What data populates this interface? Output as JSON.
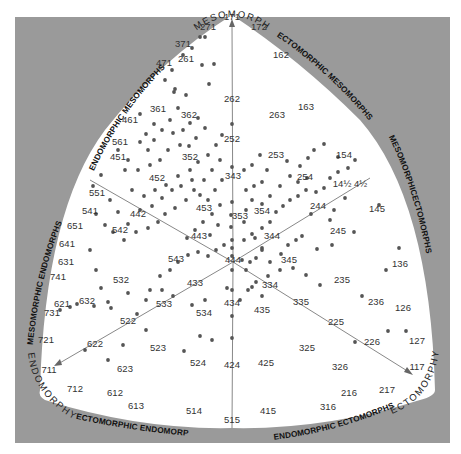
{
  "colors": {
    "frame": "#9a9a9a",
    "field": "#ffffff",
    "dot": "#555555",
    "axis": "#888888",
    "text": "#333333"
  },
  "poles": {
    "top": "MESOMORPHY",
    "left": "ENDOMORPHY",
    "right": "ECTOMORPHY"
  },
  "regions": {
    "upper_left": "ENDOMORPHIC MESOMORPHS",
    "upper_right": "ECTOMORPHIC MESOMORPHS",
    "left": "MESOMORPHIC ENDOMORPHS",
    "right": "MESOMORPHICECTOMORPHS",
    "bottom_left": "ECTOMORPHIC ENDOMORPHS",
    "bottom_right": "ENDOMORPHIC ECTOMORPHS"
  },
  "chart_data": {
    "type": "scatter",
    "title": "",
    "axes": [
      "Endomorphy",
      "Mesomorphy",
      "Ectomorphy"
    ],
    "labels": [
      {
        "text": "171",
        "x": 232,
        "y": 20
      },
      {
        "text": "172",
        "x": 259,
        "y": 30
      },
      {
        "text": "271",
        "x": 208,
        "y": 30
      },
      {
        "text": "371",
        "x": 183,
        "y": 47
      },
      {
        "text": "471",
        "x": 164,
        "y": 66
      },
      {
        "text": "261",
        "x": 186,
        "y": 62
      },
      {
        "text": "162",
        "x": 281,
        "y": 58
      },
      {
        "text": "262",
        "x": 232,
        "y": 102
      },
      {
        "text": "163",
        "x": 306,
        "y": 110
      },
      {
        "text": "263",
        "x": 277,
        "y": 118
      },
      {
        "text": "361",
        "x": 158,
        "y": 112
      },
      {
        "text": "362",
        "x": 189,
        "y": 118
      },
      {
        "text": "461",
        "x": 130,
        "y": 123
      },
      {
        "text": "561",
        "x": 120,
        "y": 145
      },
      {
        "text": "451",
        "x": 118,
        "y": 160
      },
      {
        "text": "252",
        "x": 232,
        "y": 142
      },
      {
        "text": "253",
        "x": 276,
        "y": 158
      },
      {
        "text": "154",
        "x": 344,
        "y": 158
      },
      {
        "text": "352",
        "x": 190,
        "y": 160
      },
      {
        "text": "254",
        "x": 305,
        "y": 180
      },
      {
        "text": "452",
        "x": 157,
        "y": 181
      },
      {
        "text": "343",
        "x": 233,
        "y": 179
      },
      {
        "text": "551",
        "x": 97,
        "y": 196
      },
      {
        "text": "14½ 4½",
        "x": 350,
        "y": 187
      },
      {
        "text": "541",
        "x": 90,
        "y": 214
      },
      {
        "text": "442",
        "x": 138,
        "y": 217
      },
      {
        "text": "453",
        "x": 204,
        "y": 211
      },
      {
        "text": "353",
        "x": 240,
        "y": 219
      },
      {
        "text": "354",
        "x": 262,
        "y": 214
      },
      {
        "text": "244",
        "x": 318,
        "y": 209
      },
      {
        "text": "651",
        "x": 75,
        "y": 229
      },
      {
        "text": "542",
        "x": 120,
        "y": 233
      },
      {
        "text": "443",
        "x": 199,
        "y": 239
      },
      {
        "text": "344",
        "x": 272,
        "y": 239
      },
      {
        "text": "145",
        "x": 377,
        "y": 212
      },
      {
        "text": "245",
        "x": 338,
        "y": 234
      },
      {
        "text": "641",
        "x": 67,
        "y": 247
      },
      {
        "text": "543",
        "x": 176,
        "y": 262
      },
      {
        "text": "444",
        "x": 233,
        "y": 263
      },
      {
        "text": "345",
        "x": 289,
        "y": 263
      },
      {
        "text": "631",
        "x": 66,
        "y": 265
      },
      {
        "text": "136",
        "x": 400,
        "y": 267
      },
      {
        "text": "741",
        "x": 58,
        "y": 280
      },
      {
        "text": "532",
        "x": 121,
        "y": 283
      },
      {
        "text": "235",
        "x": 342,
        "y": 283
      },
      {
        "text": "621",
        "x": 62,
        "y": 307
      },
      {
        "text": "632",
        "x": 87,
        "y": 304
      },
      {
        "text": "433",
        "x": 195,
        "y": 286
      },
      {
        "text": "334",
        "x": 270,
        "y": 288
      },
      {
        "text": "731",
        "x": 52,
        "y": 316
      },
      {
        "text": "533",
        "x": 164,
        "y": 307
      },
      {
        "text": "534",
        "x": 204,
        "y": 316
      },
      {
        "text": "434",
        "x": 232,
        "y": 306
      },
      {
        "text": "435",
        "x": 262,
        "y": 313
      },
      {
        "text": "335",
        "x": 301,
        "y": 305
      },
      {
        "text": "236",
        "x": 376,
        "y": 305
      },
      {
        "text": "126",
        "x": 403,
        "y": 311
      },
      {
        "text": "522",
        "x": 128,
        "y": 324
      },
      {
        "text": "225",
        "x": 336,
        "y": 325
      },
      {
        "text": "721",
        "x": 46,
        "y": 343
      },
      {
        "text": "622",
        "x": 95,
        "y": 347
      },
      {
        "text": "523",
        "x": 158,
        "y": 351
      },
      {
        "text": "325",
        "x": 307,
        "y": 351
      },
      {
        "text": "226",
        "x": 372,
        "y": 345
      },
      {
        "text": "127",
        "x": 417,
        "y": 344
      },
      {
        "text": "711",
        "x": 49,
        "y": 373
      },
      {
        "text": "623",
        "x": 125,
        "y": 372
      },
      {
        "text": "524",
        "x": 198,
        "y": 366
      },
      {
        "text": "424",
        "x": 232,
        "y": 368
      },
      {
        "text": "425",
        "x": 266,
        "y": 366
      },
      {
        "text": "326",
        "x": 340,
        "y": 370
      },
      {
        "text": "117",
        "x": 417,
        "y": 370
      },
      {
        "text": "712",
        "x": 75,
        "y": 392
      },
      {
        "text": "612",
        "x": 115,
        "y": 396
      },
      {
        "text": "613",
        "x": 136,
        "y": 409
      },
      {
        "text": "216",
        "x": 349,
        "y": 396
      },
      {
        "text": "217",
        "x": 387,
        "y": 393
      },
      {
        "text": "514",
        "x": 194,
        "y": 414
      },
      {
        "text": "515",
        "x": 232,
        "y": 423
      },
      {
        "text": "415",
        "x": 268,
        "y": 414
      },
      {
        "text": "316",
        "x": 328,
        "y": 410
      }
    ],
    "axis_lines": [
      {
        "from": [
          233,
          262
        ],
        "to": [
          232,
          25
        ],
        "arrow": true,
        "label": "mesomorphy axis"
      },
      {
        "from": [
          233,
          262
        ],
        "to": [
          58,
          364
        ],
        "arrow": true,
        "label": "endomorphy axis"
      },
      {
        "from": [
          233,
          262
        ],
        "to": [
          409,
          372
        ],
        "arrow": true,
        "label": "ectomorphy axis"
      },
      {
        "from": [
          233,
          262
        ],
        "to": [
          232,
          428
        ],
        "arrow": false
      },
      {
        "from": [
          233,
          262
        ],
        "to": [
          90,
          180
        ],
        "arrow": false
      },
      {
        "from": [
          233,
          262
        ],
        "to": [
          370,
          178
        ],
        "arrow": false
      }
    ],
    "points": [
      [
        200,
        37
      ],
      [
        205,
        37
      ],
      [
        192,
        48
      ],
      [
        183,
        55
      ],
      [
        214,
        64
      ],
      [
        202,
        65
      ],
      [
        172,
        70
      ],
      [
        186,
        95
      ],
      [
        174,
        92
      ],
      [
        209,
        84
      ],
      [
        232,
        124
      ],
      [
        232,
        167
      ],
      [
        232,
        202
      ],
      [
        231,
        215
      ],
      [
        231,
        227
      ],
      [
        232,
        240
      ],
      [
        232,
        248
      ],
      [
        232,
        256
      ],
      [
        175,
        89
      ],
      [
        165,
        80
      ],
      [
        140,
        114
      ],
      [
        154,
        124
      ],
      [
        146,
        134
      ],
      [
        140,
        142
      ],
      [
        148,
        150
      ],
      [
        154,
        140
      ],
      [
        162,
        130
      ],
      [
        170,
        120
      ],
      [
        178,
        108
      ],
      [
        173,
        133
      ],
      [
        183,
        130
      ],
      [
        190,
        123
      ],
      [
        198,
        118
      ],
      [
        205,
        128
      ],
      [
        196,
        138
      ],
      [
        189,
        146
      ],
      [
        180,
        145
      ],
      [
        168,
        150
      ],
      [
        160,
        160
      ],
      [
        150,
        165
      ],
      [
        138,
        170
      ],
      [
        128,
        160
      ],
      [
        118,
        150
      ],
      [
        125,
        170
      ],
      [
        132,
        190
      ],
      [
        144,
        196
      ],
      [
        155,
        190
      ],
      [
        166,
        185
      ],
      [
        178,
        176
      ],
      [
        190,
        170
      ],
      [
        198,
        162
      ],
      [
        208,
        155
      ],
      [
        216,
        145
      ],
      [
        222,
        135
      ],
      [
        220,
        160
      ],
      [
        212,
        170
      ],
      [
        204,
        180
      ],
      [
        194,
        190
      ],
      [
        186,
        200
      ],
      [
        175,
        208
      ],
      [
        165,
        214
      ],
      [
        158,
        222
      ],
      [
        148,
        228
      ],
      [
        136,
        232
      ],
      [
        124,
        240
      ],
      [
        113,
        232
      ],
      [
        105,
        225
      ],
      [
        96,
        214
      ],
      [
        93,
        186
      ],
      [
        101,
        175
      ],
      [
        110,
        200
      ],
      [
        118,
        212
      ],
      [
        128,
        224
      ],
      [
        140,
        210
      ],
      [
        152,
        206
      ],
      [
        162,
        198
      ],
      [
        172,
        190
      ],
      [
        181,
        186
      ],
      [
        192,
        180
      ],
      [
        200,
        195
      ],
      [
        208,
        200
      ],
      [
        215,
        190
      ],
      [
        222,
        180
      ],
      [
        220,
        205
      ],
      [
        212,
        214
      ],
      [
        203,
        222
      ],
      [
        195,
        230
      ],
      [
        187,
        238
      ],
      [
        210,
        235
      ],
      [
        218,
        225
      ],
      [
        224,
        245
      ],
      [
        216,
        250
      ],
      [
        208,
        256
      ],
      [
        198,
        252
      ],
      [
        188,
        255
      ],
      [
        178,
        262
      ],
      [
        170,
        270
      ],
      [
        160,
        276
      ],
      [
        150,
        290
      ],
      [
        242,
        260
      ],
      [
        250,
        262
      ],
      [
        246,
        270
      ],
      [
        256,
        258
      ],
      [
        262,
        248
      ],
      [
        255,
        238
      ],
      [
        262,
        228
      ],
      [
        270,
        222
      ],
      [
        276,
        212
      ],
      [
        283,
        206
      ],
      [
        290,
        200
      ],
      [
        298,
        196
      ],
      [
        306,
        190
      ],
      [
        316,
        192
      ],
      [
        324,
        188
      ],
      [
        330,
        178
      ],
      [
        338,
        172
      ],
      [
        348,
        168
      ],
      [
        355,
        160
      ],
      [
        246,
        190
      ],
      [
        254,
        186
      ],
      [
        262,
        182
      ],
      [
        270,
        196
      ],
      [
        280,
        186
      ],
      [
        290,
        176
      ],
      [
        300,
        166
      ],
      [
        308,
        158
      ],
      [
        314,
        150
      ],
      [
        324,
        144
      ],
      [
        244,
        170
      ],
      [
        252,
        165
      ],
      [
        260,
        155
      ],
      [
        267,
        170
      ],
      [
        287,
        161
      ],
      [
        298,
        182
      ],
      [
        307,
        178
      ],
      [
        338,
        157
      ],
      [
        246,
        210
      ],
      [
        252,
        200
      ],
      [
        262,
        204
      ],
      [
        244,
        222
      ],
      [
        252,
        234
      ],
      [
        244,
        240
      ],
      [
        262,
        250
      ],
      [
        270,
        262
      ],
      [
        281,
        254
      ],
      [
        288,
        245
      ],
      [
        296,
        240
      ],
      [
        302,
        236
      ],
      [
        311,
        214
      ],
      [
        330,
        220
      ],
      [
        334,
        210
      ],
      [
        345,
        198
      ],
      [
        354,
        232
      ],
      [
        317,
        249
      ],
      [
        332,
        245
      ],
      [
        362,
        296
      ],
      [
        320,
        285
      ],
      [
        306,
        275
      ],
      [
        293,
        268
      ],
      [
        280,
        270
      ],
      [
        268,
        276
      ],
      [
        256,
        282
      ],
      [
        248,
        290
      ],
      [
        240,
        300
      ],
      [
        232,
        290
      ],
      [
        232,
        270
      ],
      [
        232,
        316
      ],
      [
        232,
        338
      ],
      [
        252,
        287
      ],
      [
        262,
        296
      ],
      [
        227,
        288
      ],
      [
        205,
        300
      ],
      [
        192,
        305
      ],
      [
        173,
        296
      ],
      [
        162,
        290
      ],
      [
        146,
        300
      ],
      [
        128,
        293
      ],
      [
        108,
        302
      ],
      [
        94,
        306
      ],
      [
        77,
        304
      ],
      [
        70,
        307
      ],
      [
        90,
        250
      ],
      [
        96,
        270
      ],
      [
        101,
        288
      ],
      [
        137,
        314
      ],
      [
        146,
        330
      ],
      [
        123,
        345
      ],
      [
        111,
        308
      ],
      [
        85,
        350
      ],
      [
        200,
        336
      ],
      [
        184,
        351
      ],
      [
        212,
        340
      ],
      [
        388,
        331
      ],
      [
        406,
        331
      ],
      [
        355,
        342
      ],
      [
        379,
        205
      ],
      [
        399,
        248
      ],
      [
        386,
        270
      ],
      [
        108,
        360
      ],
      [
        60,
        310
      ]
    ]
  }
}
